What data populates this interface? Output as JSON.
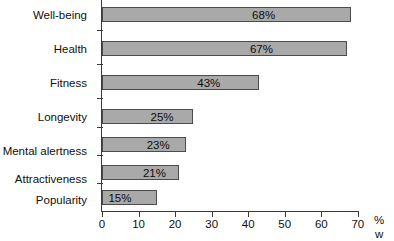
{
  "chart_data": {
    "type": "bar",
    "orientation": "horizontal",
    "title": "",
    "xlabel": "%",
    "ylabel": "",
    "xlim": [
      0,
      70
    ],
    "xticks": [
      0,
      10,
      20,
      30,
      40,
      50,
      60,
      70
    ],
    "grid": false,
    "legend": false,
    "categories": [
      "Well-being",
      "Health",
      "Fitness",
      "Longevity",
      "Mental alertness",
      "Attractiveness",
      "Popularity"
    ],
    "values": [
      68,
      67,
      43,
      25,
      23,
      21,
      15
    ],
    "value_labels": [
      "68%",
      "67%",
      "43%",
      "25%",
      "23%",
      "21%",
      "15%"
    ],
    "bar_color": "#a9a9a9",
    "bar_border_color": "#4c4c4c",
    "axis_color": "#3a3a3a"
  },
  "axis": {
    "unit_label": "%",
    "unit_label_continued": "w",
    "tick_labels": [
      "0",
      "10",
      "20",
      "30",
      "40",
      "50",
      "60",
      "70"
    ]
  }
}
